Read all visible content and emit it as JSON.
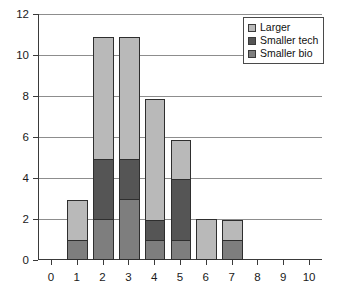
{
  "chart_data": {
    "type": "bar",
    "stacked": true,
    "title": "",
    "xlabel": "",
    "ylabel": "",
    "categories": [
      "0",
      "1",
      "2",
      "3",
      "4",
      "5",
      "6",
      "7",
      "8",
      "9",
      "10"
    ],
    "x": [
      0,
      1,
      2,
      3,
      4,
      5,
      6,
      7,
      8,
      9,
      10
    ],
    "series": [
      {
        "name": "Smaller bio",
        "color": "#7e7e7e",
        "values": [
          0,
          1,
          2,
          3,
          1,
          1,
          0,
          1,
          0,
          0,
          0
        ]
      },
      {
        "name": "Smaller tech",
        "color": "#555555",
        "values": [
          0,
          0,
          3,
          2,
          1,
          3,
          0,
          0,
          0,
          0,
          0
        ]
      },
      {
        "name": "Larger",
        "color": "#b9b9b9",
        "values": [
          0,
          2,
          6,
          6,
          6,
          2,
          2,
          1,
          0,
          0,
          0
        ]
      }
    ],
    "totals": [
      0,
      3,
      11,
      11,
      8,
      6,
      2,
      2,
      0,
      0,
      0
    ],
    "ylim": [
      0,
      12
    ],
    "yticks": [
      0,
      2,
      4,
      6,
      8,
      10,
      12
    ],
    "ytick_labels": [
      "0",
      "2",
      "4",
      "6",
      "8",
      "10",
      "12"
    ],
    "xlim": [
      -0.5,
      10.5
    ],
    "xticks": [
      0,
      1,
      2,
      3,
      4,
      5,
      6,
      7,
      8,
      9,
      10
    ],
    "xtick_labels": [
      "0",
      "1",
      "2",
      "3",
      "4",
      "5",
      "6",
      "7",
      "8",
      "9",
      "10"
    ],
    "grid": "horizontal",
    "legend_position": "top-right",
    "legend": [
      {
        "label": "Larger",
        "color": "#b9b9b9"
      },
      {
        "label": "Smaller tech",
        "color": "#555555"
      },
      {
        "label": "Smaller bio",
        "color": "#7e7e7e"
      }
    ]
  }
}
